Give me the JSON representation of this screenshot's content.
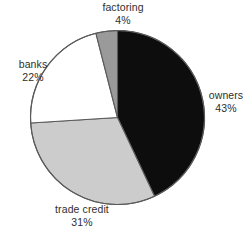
{
  "chart_data": {
    "type": "pie",
    "title": "",
    "subtitle": "",
    "xlabel": "",
    "ylabel": "",
    "grid": false,
    "legend_position": "none",
    "label_format": "name-above-percent",
    "start_angle_deg": 0,
    "direction": "clockwise",
    "categories": [
      "owners",
      "trade credit",
      "banks",
      "factoring"
    ],
    "values": [
      43,
      31,
      22,
      4
    ],
    "unit": "%",
    "slices": [
      {
        "name": "owners",
        "value": 43,
        "percent_label": "43%",
        "color": "#0d0d0d",
        "label_position": "right"
      },
      {
        "name": "trade credit",
        "value": 31,
        "percent_label": "31%",
        "color": "#cccccc",
        "label_position": "bottom"
      },
      {
        "name": "banks",
        "value": 22,
        "percent_label": "22%",
        "color": "#ffffff",
        "label_position": "left"
      },
      {
        "name": "factoring",
        "value": 4,
        "percent_label": "4%",
        "color": "#9a9a9a",
        "label_position": "top"
      }
    ]
  },
  "style": {
    "background": "#ffffff",
    "text_color": "#2e2e2e",
    "outline_color": "#5a5a5a"
  }
}
